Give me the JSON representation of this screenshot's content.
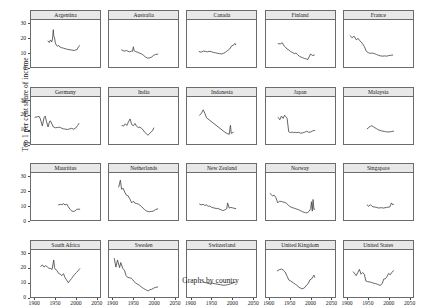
{
  "chart_data": {
    "type": "line",
    "title": "",
    "caption": "Graphs by country",
    "ylabel": "Top 1 per cent share of income",
    "xlabel": "",
    "xlim": [
      1890,
      2060
    ],
    "ylim": [
      0,
      33
    ],
    "xticks": [
      1900,
      1950,
      2000,
      2050
    ],
    "xticklabels": [
      "1900",
      "1950",
      "2000",
      "2050"
    ],
    "yticks": [
      0,
      10,
      20,
      30
    ],
    "yticklabels": [
      "0",
      "10",
      "20",
      "30"
    ],
    "grid": false,
    "legend": "none",
    "layout": {
      "rows": 4,
      "cols": 5
    },
    "line_color": "#4a4a4a",
    "panel_header_color": "#e8e8e8",
    "panel_border_color": "#6b6b6b",
    "panels": [
      {
        "title": "Argentina",
        "x": [
          1932,
          1935,
          1938,
          1941,
          1943,
          1945,
          1946,
          1948,
          1950,
          1953,
          1956,
          1958,
          1961,
          1965,
          1970,
          1975,
          1980,
          1990,
          1997,
          2004,
          2007,
          2010
        ],
        "y": [
          18.2,
          17.2,
          19.0,
          17.6,
          19.6,
          26.2,
          22.0,
          20.5,
          16.8,
          15.0,
          14.6,
          15.2,
          14.0,
          13.6,
          13.2,
          12.8,
          12.4,
          11.9,
          11.6,
          12.4,
          14.2,
          15.0
        ]
      },
      {
        "title": "Australia",
        "x": [
          1921,
          1925,
          1929,
          1933,
          1937,
          1941,
          1945,
          1948,
          1950,
          1952,
          1956,
          1960,
          1965,
          1970,
          1975,
          1980,
          1985,
          1990,
          1995,
          2000,
          2005,
          2010
        ],
        "y": [
          12.0,
          11.4,
          11.2,
          11.6,
          11.0,
          10.6,
          11.2,
          11.0,
          14.2,
          11.4,
          10.8,
          10.4,
          9.8,
          9.2,
          8.2,
          7.0,
          6.2,
          6.4,
          7.0,
          8.2,
          8.8,
          9.0
        ]
      },
      {
        "title": "Canada",
        "x": [
          1920,
          1925,
          1930,
          1935,
          1940,
          1945,
          1950,
          1955,
          1960,
          1965,
          1970,
          1975,
          1980,
          1985,
          1990,
          1995,
          2000,
          2005,
          2008,
          2010
        ],
        "y": [
          10.8,
          10.4,
          11.2,
          11.0,
          10.6,
          11.0,
          10.8,
          10.2,
          10.0,
          9.6,
          9.4,
          9.2,
          9.6,
          10.4,
          11.6,
          12.6,
          14.8,
          15.4,
          16.6,
          15.6
        ]
      },
      {
        "title": "Finland",
        "x": [
          1920,
          1925,
          1930,
          1935,
          1938,
          1942,
          1946,
          1950,
          1955,
          1960,
          1964,
          1968,
          1972,
          1976,
          1980,
          1985,
          1990,
          1993,
          1996,
          2000,
          2004,
          2009
        ],
        "y": [
          16.4,
          16.2,
          17.0,
          14.6,
          14.0,
          12.6,
          12.0,
          11.0,
          10.2,
          9.4,
          9.8,
          8.6,
          7.6,
          7.0,
          6.6,
          6.0,
          5.6,
          5.2,
          7.0,
          9.2,
          8.0,
          8.4
        ]
      },
      {
        "title": "France",
        "x": [
          1905,
          1910,
          1915,
          1920,
          1925,
          1929,
          1932,
          1936,
          1940,
          1945,
          1950,
          1955,
          1960,
          1965,
          1970,
          1975,
          1980,
          1985,
          1990,
          1995,
          2000,
          2005,
          2010
        ],
        "y": [
          22.0,
          20.6,
          21.6,
          19.2,
          20.0,
          18.4,
          17.6,
          16.2,
          14.4,
          11.0,
          10.0,
          9.6,
          9.8,
          9.4,
          8.8,
          8.2,
          7.8,
          7.6,
          7.8,
          7.6,
          8.0,
          8.2,
          8.4
        ]
      },
      {
        "title": "Germany",
        "x": [
          1900,
          1905,
          1910,
          1913,
          1918,
          1922,
          1925,
          1928,
          1932,
          1936,
          1938,
          1945,
          1950,
          1955,
          1960,
          1965,
          1970,
          1975,
          1980,
          1985,
          1990,
          1995,
          2000,
          2005,
          2008
        ],
        "y": [
          18.8,
          19.0,
          19.4,
          17.6,
          12.6,
          18.4,
          19.6,
          16.0,
          12.0,
          16.0,
          16.2,
          12.0,
          11.4,
          11.6,
          11.8,
          11.2,
          10.6,
          10.4,
          10.2,
          10.6,
          11.0,
          10.4,
          11.2,
          13.0,
          14.4
        ]
      },
      {
        "title": "India",
        "x": [
          1922,
          1926,
          1930,
          1934,
          1938,
          1942,
          1946,
          1950,
          1954,
          1958,
          1962,
          1966,
          1970,
          1974,
          1978,
          1982,
          1986,
          1990,
          1994,
          1998,
          2000
        ],
        "y": [
          13.0,
          12.6,
          14.2,
          13.0,
          15.6,
          17.6,
          13.6,
          12.8,
          14.4,
          12.4,
          11.6,
          11.8,
          11.0,
          10.0,
          8.2,
          7.2,
          6.2,
          7.2,
          8.6,
          9.6,
          11.2
        ]
      },
      {
        "title": "Indonesia",
        "x": [
          1921,
          1926,
          1930,
          1934,
          1938,
          1982,
          1986,
          1990,
          1994,
          1997,
          1999,
          2001,
          2004
        ],
        "y": [
          20.2,
          21.8,
          24.0,
          21.6,
          18.4,
          8.6,
          7.8,
          7.2,
          6.8,
          13.2,
          7.4,
          7.8,
          8.2
        ]
      },
      {
        "title": "Japan",
        "x": [
          1920,
          1924,
          1928,
          1932,
          1936,
          1938,
          1942,
          1946,
          1950,
          1954,
          1958,
          1962,
          1966,
          1970,
          1975,
          1980,
          1985,
          1990,
          1995,
          2000,
          2005,
          2010
        ],
        "y": [
          18.6,
          17.0,
          19.6,
          18.0,
          20.2,
          19.4,
          18.0,
          8.6,
          8.0,
          8.4,
          8.0,
          8.2,
          8.0,
          8.2,
          7.6,
          7.8,
          8.2,
          9.0,
          8.2,
          8.4,
          9.2,
          9.6
        ]
      },
      {
        "title": "Malaysia",
        "x": [
          1947,
          1951,
          1955,
          1959,
          1962,
          1966,
          1970,
          1974,
          1978,
          1982,
          1986,
          1990,
          1994,
          1998,
          2004,
          2008,
          2012
        ],
        "y": [
          10.6,
          11.6,
          12.4,
          12.8,
          12.2,
          11.4,
          10.8,
          10.0,
          9.6,
          9.2,
          9.0,
          8.8,
          8.6,
          8.4,
          8.6,
          8.8,
          9.0
        ]
      },
      {
        "title": "Mauritius",
        "x": [
          1958,
          1962,
          1966,
          1970,
          1974,
          1978,
          1982,
          1986,
          1990,
          1994,
          1998,
          2002,
          2006,
          2010
        ],
        "y": [
          10.6,
          11.0,
          10.8,
          11.4,
          10.6,
          11.2,
          9.2,
          7.6,
          6.4,
          6.0,
          6.2,
          7.4,
          7.6,
          7.6
        ]
      },
      {
        "title": "Netherlands",
        "x": [
          1914,
          1918,
          1921,
          1925,
          1929,
          1933,
          1937,
          1941,
          1946,
          1950,
          1954,
          1958,
          1962,
          1966,
          1970,
          1974,
          1978,
          1982,
          1986,
          1990,
          1994,
          1999,
          2005,
          2010
        ],
        "y": [
          23.2,
          28.0,
          21.6,
          22.2,
          19.4,
          17.4,
          17.0,
          15.0,
          12.0,
          13.2,
          11.8,
          11.6,
          11.2,
          10.4,
          9.4,
          8.4,
          7.2,
          6.4,
          6.0,
          5.8,
          6.0,
          6.2,
          7.4,
          7.8
        ]
      },
      {
        "title": "New Zealand",
        "x": [
          1921,
          1925,
          1930,
          1934,
          1938,
          1942,
          1946,
          1950,
          1954,
          1958,
          1962,
          1966,
          1970,
          1974,
          1978,
          1982,
          1986,
          1988,
          1990,
          1994,
          1998,
          2002,
          2006,
          2010
        ],
        "y": [
          11.2,
          10.6,
          11.0,
          10.2,
          10.6,
          9.6,
          9.8,
          9.0,
          8.6,
          8.4,
          8.0,
          8.2,
          7.6,
          7.2,
          6.6,
          7.0,
          7.6,
          8.0,
          12.0,
          8.4,
          8.8,
          8.6,
          8.2,
          8.0
        ]
      },
      {
        "title": "Norway",
        "x": [
          1900,
          1906,
          1910,
          1914,
          1919,
          1923,
          1928,
          1932,
          1936,
          1940,
          1948,
          1952,
          1956,
          1960,
          1964,
          1968,
          1972,
          1976,
          1980,
          1984,
          1988,
          1992,
          1996,
          2000,
          2002,
          2004,
          2006,
          2008,
          2010
        ],
        "y": [
          18.6,
          17.0,
          17.4,
          16.0,
          12.0,
          13.2,
          13.0,
          12.6,
          12.4,
          11.8,
          9.6,
          9.0,
          8.6,
          8.2,
          7.8,
          7.4,
          7.0,
          6.4,
          5.8,
          5.4,
          5.0,
          5.2,
          6.0,
          8.0,
          12.8,
          6.2,
          14.4,
          7.4,
          7.6
        ]
      },
      {
        "title": "Singapore",
        "x": [
          1947,
          1951,
          1955,
          1959,
          1963,
          1967,
          1971,
          1975,
          1979,
          1983,
          1987,
          1991,
          1995,
          1999,
          2003,
          2005,
          2007,
          2009,
          2012
        ],
        "y": [
          10.6,
          9.6,
          10.8,
          9.6,
          9.2,
          9.0,
          8.8,
          8.4,
          8.6,
          8.6,
          8.4,
          8.6,
          8.8,
          9.0,
          9.2,
          10.8,
          12.0,
          10.8,
          11.0
        ]
      },
      {
        "title": "South Africa",
        "x": [
          1914,
          1918,
          1922,
          1926,
          1930,
          1934,
          1938,
          1942,
          1946,
          1948,
          1950,
          1954,
          1958,
          1962,
          1966,
          1970,
          1974,
          1978,
          1982,
          1986,
          1990,
          1994,
          1998,
          2002,
          2006,
          2010
        ],
        "y": [
          21.4,
          22.6,
          21.0,
          22.0,
          21.2,
          20.2,
          20.0,
          19.4,
          26.0,
          20.6,
          19.4,
          18.6,
          16.6,
          16.0,
          15.0,
          16.4,
          13.6,
          11.8,
          10.0,
          11.6,
          13.0,
          14.6,
          16.0,
          17.2,
          18.4,
          19.8
        ]
      },
      {
        "title": "Sweden",
        "x": [
          1903,
          1907,
          1911,
          1916,
          1919,
          1924,
          1928,
          1932,
          1935,
          1941,
          1945,
          1948,
          1951,
          1955,
          1960,
          1965,
          1970,
          1975,
          1980,
          1984,
          1988,
          1991,
          1995,
          2000,
          2005,
          2010
        ],
        "y": [
          27.0,
          21.0,
          26.0,
          20.6,
          24.2,
          20.0,
          18.8,
          15.0,
          14.0,
          13.4,
          13.2,
          12.4,
          11.0,
          10.0,
          9.0,
          8.2,
          7.0,
          6.0,
          5.2,
          4.6,
          4.4,
          5.2,
          5.4,
          6.2,
          6.8,
          7.0
        ]
      },
      {
        "title": "Switzerland",
        "x": [
          1933,
          1937,
          1941,
          1945,
          1949,
          1953,
          1957,
          1961,
          1965,
          1969,
          1973,
          1977,
          1981,
          1985,
          1989,
          1993,
          1997,
          2001,
          2005,
          2009
        ],
        "y": [
          10.2,
          10.0,
          9.6,
          9.4,
          9.8,
          9.6,
          9.4,
          9.2,
          9.0,
          8.8,
          8.6,
          8.4,
          8.2,
          8.4,
          8.6,
          8.8,
          9.2,
          9.6,
          10.0,
          10.4
        ]
      },
      {
        "title": "United Kingdom",
        "x": [
          1918,
          1923,
          1928,
          1932,
          1937,
          1942,
          1946,
          1950,
          1954,
          1958,
          1962,
          1966,
          1970,
          1974,
          1978,
          1982,
          1986,
          1990,
          1994,
          1998,
          2002,
          2006,
          2008,
          2010
        ],
        "y": [
          18.4,
          19.2,
          19.6,
          19.0,
          17.6,
          14.6,
          12.0,
          11.4,
          10.6,
          9.8,
          9.0,
          8.2,
          7.2,
          6.4,
          5.8,
          6.0,
          6.8,
          8.4,
          9.4,
          12.0,
          12.6,
          14.4,
          15.4,
          13.8
        ]
      },
      {
        "title": "United States",
        "x": [
          1913,
          1917,
          1920,
          1924,
          1928,
          1932,
          1936,
          1940,
          1944,
          1948,
          1952,
          1956,
          1960,
          1964,
          1968,
          1972,
          1976,
          1980,
          1984,
          1988,
          1992,
          1996,
          2000,
          2004,
          2008,
          2012
        ],
        "y": [
          17.6,
          16.2,
          15.0,
          17.2,
          19.4,
          16.0,
          17.2,
          16.0,
          11.2,
          10.8,
          10.6,
          10.4,
          10.0,
          9.6,
          9.4,
          9.0,
          8.4,
          8.2,
          9.4,
          12.6,
          12.8,
          14.4,
          16.6,
          15.6,
          17.4,
          18.4
        ]
      }
    ]
  }
}
